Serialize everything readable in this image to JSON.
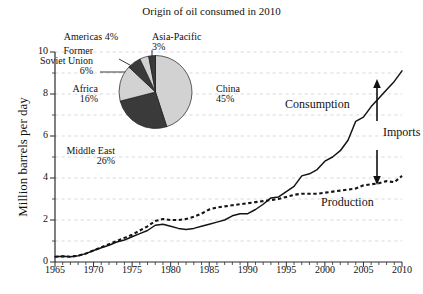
{
  "figure": {
    "pie_title": "Origin of oil consumed in 2010",
    "y_axis_label": "Million barrels per day"
  },
  "axis": {
    "x_ticks": [
      "1965",
      "1970",
      "1975",
      "1980",
      "1985",
      "1990",
      "1995",
      "2000",
      "2005",
      "2010"
    ],
    "y_ticks": [
      "0",
      "2",
      "4",
      "6",
      "8",
      "10"
    ]
  },
  "annotations": {
    "consumption": "Consumption",
    "production": "Production",
    "imports": "Imports"
  },
  "pie_labels": {
    "americas": "Americas 4%",
    "asia_pacific_name": "Asia-Pacific",
    "asia_pacific_pct": "3%",
    "fsu_line1": "Former",
    "fsu_line2": "Soviet Union",
    "fsu_pct": "6%",
    "africa_name": "Africa",
    "africa_pct": "16%",
    "middle_east_name": "Middle East",
    "middle_east_pct": "26%",
    "china_name": "China",
    "china_pct": "45%"
  },
  "colors": {
    "light_wedge": "#d2d2d2",
    "dark_wedge": "#3a3a3a",
    "line": "#141414",
    "grid": "#c9c9c9"
  },
  "chart_data": [
    {
      "type": "line",
      "title": "",
      "xlabel": "",
      "ylabel": "Million barrels per day",
      "xlim": [
        1965,
        2010
      ],
      "ylim": [
        0,
        10
      ],
      "grid": true,
      "legend": "inline annotations",
      "x": [
        1965,
        1966,
        1967,
        1968,
        1969,
        1970,
        1971,
        1972,
        1973,
        1974,
        1975,
        1976,
        1977,
        1978,
        1979,
        1980,
        1981,
        1982,
        1983,
        1984,
        1985,
        1986,
        1987,
        1988,
        1989,
        1990,
        1991,
        1992,
        1993,
        1994,
        1995,
        1996,
        1997,
        1998,
        1999,
        2000,
        2001,
        2002,
        2003,
        2004,
        2005,
        2006,
        2007,
        2008,
        2009,
        2010
      ],
      "series": [
        {
          "name": "Consumption",
          "style": "solid",
          "values": [
            0.25,
            0.27,
            0.25,
            0.3,
            0.4,
            0.55,
            0.68,
            0.8,
            0.95,
            1.05,
            1.2,
            1.35,
            1.5,
            1.75,
            1.8,
            1.7,
            1.6,
            1.55,
            1.6,
            1.7,
            1.8,
            1.9,
            2.0,
            2.2,
            2.3,
            2.3,
            2.5,
            2.75,
            3.05,
            3.1,
            3.35,
            3.6,
            4.1,
            4.2,
            4.4,
            4.8,
            5.0,
            5.3,
            5.8,
            6.7,
            6.9,
            7.4,
            7.8,
            8.2,
            8.6,
            9.1
          ]
        },
        {
          "name": "Production",
          "style": "dashed",
          "values": [
            0.25,
            0.27,
            0.25,
            0.3,
            0.4,
            0.55,
            0.7,
            0.85,
            1.0,
            1.15,
            1.3,
            1.5,
            1.7,
            1.95,
            2.05,
            2.0,
            2.0,
            2.05,
            2.15,
            2.3,
            2.5,
            2.6,
            2.65,
            2.7,
            2.75,
            2.8,
            2.85,
            2.9,
            2.95,
            3.0,
            3.1,
            3.2,
            3.25,
            3.25,
            3.25,
            3.3,
            3.35,
            3.4,
            3.45,
            3.5,
            3.65,
            3.7,
            3.75,
            3.85,
            3.8,
            4.1
          ]
        }
      ],
      "annotations": [
        {
          "text": "Consumption",
          "x": 2000,
          "y": 7.8
        },
        {
          "text": "Production",
          "x": 2003,
          "y": 2.9
        },
        {
          "text": "Imports",
          "x": 2009,
          "y": 6.1,
          "marker": "double-arrow from 8.1 to 4.1 at 2009"
        }
      ]
    },
    {
      "type": "pie",
      "title": "Origin of oil consumed in 2010",
      "labels": [
        "China",
        "Middle East",
        "Africa",
        "Former Soviet Union",
        "Americas",
        "Asia-Pacific"
      ],
      "values": [
        45,
        26,
        16,
        6,
        4,
        3
      ],
      "unit": "%",
      "colors": [
        "#d2d2d2",
        "#3a3a3a",
        "#d2d2d2",
        "#3a3a3a",
        "#d2d2d2",
        "#3a3a3a"
      ],
      "start_angle_deg": 0,
      "direction": "clockwise"
    }
  ]
}
